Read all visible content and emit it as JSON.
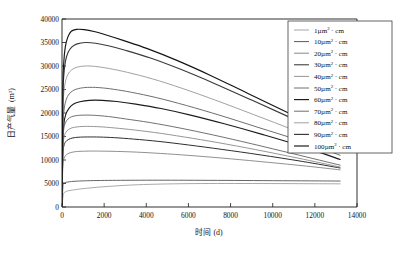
{
  "chart_data": {
    "type": "line",
    "title": "",
    "xlabel": "时间 (d)",
    "ylabel": "日产气量 (m³)",
    "ylabel_main": "日产气量",
    "ylabel_unit": "m",
    "ylabel_unit_sup": "3",
    "xlim": [
      0,
      14000
    ],
    "ylim": [
      0,
      40000
    ],
    "grid": false,
    "legend_position": "top-right",
    "xticks": [
      0,
      2000,
      4000,
      6000,
      8000,
      10000,
      12000,
      14000
    ],
    "yticks": [
      0,
      5000,
      10000,
      15000,
      20000,
      25000,
      30000,
      35000,
      40000
    ],
    "xtick_labels": [
      "0",
      "2000",
      "4000",
      "6000",
      "8000",
      "10000",
      "12000",
      "14000"
    ],
    "ytick_labels": [
      "0",
      "5000",
      "10000",
      "15000",
      "20000",
      "25000",
      "30000",
      "35000",
      "40000"
    ],
    "unit_symbol": "µm",
    "unit_sup": "2",
    "unit_suffix": "· cm",
    "series": [
      {
        "name": "1µm² · cm",
        "value_label": "1",
        "color": "#9a9a9a",
        "width": 0.85,
        "x": [
          0,
          60,
          150,
          300,
          500,
          800,
          1200,
          1800,
          2600,
          3400,
          4400,
          5600,
          7000,
          8600,
          10400,
          12000,
          13200
        ],
        "y": [
          0,
          2600,
          3200,
          3450,
          3600,
          3800,
          4000,
          4250,
          4500,
          4700,
          4850,
          4950,
          5000,
          5000,
          4980,
          4950,
          4930
        ]
      },
      {
        "name": "10µm² · cm",
        "value_label": "10",
        "color": "#4a4a4a",
        "width": 0.85,
        "x": [
          0,
          50,
          120,
          260,
          450,
          700,
          1000,
          1500,
          2200,
          3000,
          4000,
          5200,
          6600,
          8200,
          10000,
          11800,
          13200
        ],
        "y": [
          0,
          4700,
          5150,
          5300,
          5420,
          5500,
          5560,
          5620,
          5660,
          5680,
          5700,
          5700,
          5680,
          5650,
          5600,
          5560,
          5520
        ]
      },
      {
        "name": "20µm² · cm",
        "value_label": "20",
        "color": "#7c7c7c",
        "width": 0.85,
        "x": [
          0,
          40,
          100,
          200,
          360,
          600,
          900,
          1400,
          2000,
          2800,
          3800,
          5000,
          6400,
          8000,
          9800,
          11600,
          13200
        ],
        "y": [
          0,
          8900,
          10400,
          11100,
          11500,
          11750,
          11850,
          11900,
          11880,
          11800,
          11620,
          11300,
          10850,
          10250,
          9500,
          8700,
          7900
        ]
      },
      {
        "name": "30µm² · cm",
        "value_label": "30",
        "color": "#2e2e2e",
        "width": 1.0,
        "x": [
          0,
          40,
          90,
          180,
          320,
          520,
          800,
          1200,
          1800,
          2500,
          3400,
          4600,
          6000,
          7600,
          9400,
          11400,
          13200
        ],
        "y": [
          0,
          10900,
          13000,
          13900,
          14400,
          14700,
          14850,
          14900,
          14880,
          14750,
          14450,
          13950,
          13200,
          12250,
          11100,
          9700,
          8300
        ]
      },
      {
        "name": "40µm² · cm",
        "value_label": "40",
        "color": "#8a8a8a",
        "width": 0.9,
        "x": [
          0,
          40,
          90,
          170,
          300,
          480,
          740,
          1100,
          1650,
          2300,
          3200,
          4400,
          5800,
          7400,
          9200,
          11200,
          13200
        ],
        "y": [
          0,
          12100,
          14700,
          15800,
          16450,
          16850,
          17050,
          17150,
          17100,
          16900,
          16500,
          15850,
          14900,
          13700,
          12200,
          10400,
          8500
        ]
      },
      {
        "name": "50µm² · cm",
        "value_label": "50",
        "color": "#616161",
        "width": 0.9,
        "x": [
          0,
          40,
          85,
          160,
          280,
          450,
          700,
          1050,
          1550,
          2200,
          3000,
          4200,
          5600,
          7200,
          9000,
          11000,
          13200
        ],
        "y": [
          0,
          13500,
          16600,
          17900,
          18700,
          19200,
          19450,
          19550,
          19500,
          19250,
          18750,
          17950,
          16800,
          15300,
          13450,
          11300,
          8900
        ]
      },
      {
        "name": "60µm² · cm",
        "value_label": "60",
        "color": "#1c1c1c",
        "width": 1.15,
        "x": [
          0,
          40,
          90,
          180,
          330,
          550,
          850,
          1300,
          1900,
          2600,
          3500,
          4700,
          6100,
          7700,
          9500,
          11400,
          13200
        ],
        "y": [
          0,
          14200,
          17800,
          19700,
          21000,
          21900,
          22400,
          22700,
          22700,
          22450,
          21900,
          20950,
          19550,
          17700,
          15450,
          12900,
          10100
        ]
      },
      {
        "name": "70µm² · cm",
        "value_label": "70",
        "color": "#6e6e6e",
        "width": 1.0,
        "x": [
          0,
          40,
          90,
          170,
          300,
          500,
          780,
          1200,
          1750,
          2450,
          3300,
          4500,
          5900,
          7500,
          9300,
          11300,
          13200
        ],
        "y": [
          0,
          16400,
          20300,
          22400,
          23800,
          24700,
          25200,
          25450,
          25400,
          25050,
          24400,
          23250,
          21600,
          19500,
          16950,
          14100,
          11000
        ]
      },
      {
        "name": "80µm² · cm",
        "value_label": "80",
        "color": "#a2a2a2",
        "width": 1.0,
        "x": [
          0,
          40,
          85,
          160,
          280,
          460,
          720,
          1100,
          1600,
          2250,
          3100,
          4300,
          5700,
          7300,
          9100,
          11100,
          13200
        ],
        "y": [
          0,
          19700,
          24200,
          26600,
          28200,
          29200,
          29750,
          30000,
          29900,
          29450,
          28650,
          27250,
          25250,
          22700,
          19650,
          16200,
          12400
        ]
      },
      {
        "name": "90µm² · cm",
        "value_label": "90",
        "color": "#3a3a3a",
        "width": 1.15,
        "x": [
          0,
          40,
          85,
          160,
          280,
          460,
          720,
          1100,
          1600,
          2200,
          3000,
          4200,
          5600,
          7200,
          9000,
          11000,
          13200
        ],
        "y": [
          0,
          22600,
          28000,
          30900,
          32800,
          34000,
          34700,
          35000,
          34850,
          34300,
          33350,
          31700,
          29350,
          26350,
          22750,
          18700,
          14200
        ]
      },
      {
        "name": "100µm² · cm",
        "value_label": "100",
        "color": "#141414",
        "width": 1.15,
        "x": [
          0,
          40,
          85,
          155,
          270,
          440,
          690,
          1050,
          1520,
          2100,
          2900,
          4050,
          5450,
          7050,
          8850,
          10900,
          13200
        ],
        "y": [
          0,
          24900,
          30800,
          34000,
          36100,
          37400,
          37800,
          37750,
          37350,
          36600,
          35450,
          33700,
          31200,
          28000,
          24100,
          19700,
          14900
        ]
      }
    ]
  },
  "legend": {
    "entries": [
      "1µm² · cm",
      "10µm² · cm",
      "20µm² · cm",
      "30µm² · cm",
      "40µm² · cm",
      "50µm² · cm",
      "60µm² · cm",
      "70µm² · cm",
      "80µm² · cm",
      "90µm² · cm",
      "100µm² · cm"
    ]
  },
  "colors": {
    "axis": "#1a1a1a",
    "background": "#ffffff",
    "legend_border": "#4a4a4a",
    "text": "#121212"
  }
}
